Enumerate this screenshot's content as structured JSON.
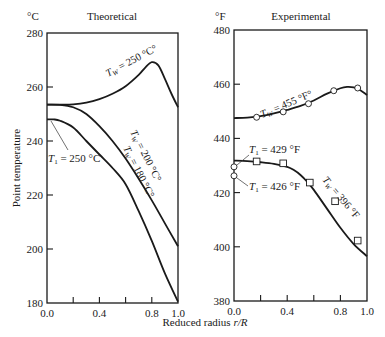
{
  "figure": {
    "ylabel": "Point temperature",
    "xlabel": "Reduced radius r/R",
    "xlabel_plain": "Reduced radius ",
    "xlabel_italic": "r/R"
  },
  "chart_data": [
    {
      "type": "line",
      "title": "Theoretical",
      "unit_label": "°C",
      "xlabel": "Reduced radius r/R",
      "ylabel": "Point temperature",
      "xlim": [
        0.0,
        1.0
      ],
      "ylim": [
        180,
        280
      ],
      "xticks": [
        0.0,
        0.2,
        0.4,
        0.6,
        0.8,
        1.0
      ],
      "xtick_labels": [
        "0.0",
        "0.4",
        "0.8",
        "1.0"
      ],
      "yticks": [
        180,
        200,
        220,
        240,
        260,
        280
      ],
      "ytick_labels": [
        "180",
        "200",
        "220",
        "240",
        "260",
        "280"
      ],
      "grid": false,
      "series": [
        {
          "name": "Tw = 250 °C",
          "label": "T_W = 250 °C",
          "x": [
            0.0,
            0.1,
            0.2,
            0.3,
            0.4,
            0.5,
            0.6,
            0.7,
            0.75,
            0.8,
            0.85,
            0.9,
            0.95,
            1.0
          ],
          "y": [
            253.5,
            253.5,
            253.6,
            254.2,
            255.5,
            257.5,
            260.3,
            264.5,
            267.2,
            269.2,
            268.0,
            263.0,
            257.5,
            252.5
          ]
        },
        {
          "name": "Tw = 200 °C",
          "label": "T_W = 200 °C",
          "x": [
            0.0,
            0.1,
            0.2,
            0.3,
            0.4,
            0.5,
            0.6,
            0.7,
            0.8,
            0.9,
            1.0
          ],
          "y": [
            253.5,
            253.4,
            252.5,
            250.0,
            245.5,
            240.0,
            233.5,
            226.0,
            218.0,
            209.5,
            201.0
          ]
        },
        {
          "name": "Tw = 180 °C",
          "label": "T_W = 180 °C",
          "x": [
            0.0,
            0.05,
            0.1,
            0.2,
            0.3,
            0.4,
            0.5,
            0.6,
            0.7,
            0.8,
            0.9,
            1.0
          ],
          "y": [
            248.0,
            248.0,
            247.5,
            245.0,
            240.0,
            235.0,
            230.0,
            224.0,
            214.0,
            203.0,
            191.0,
            180.5
          ]
        }
      ],
      "annotations": [
        {
          "text": "T_1 = 250 °C",
          "points_to": {
            "x": 0.02,
            "y": 248
          }
        }
      ]
    },
    {
      "type": "line",
      "title": "Experimental",
      "unit_label": "°F",
      "xlabel": "Reduced radius r/R",
      "xlim": [
        0.0,
        1.0
      ],
      "ylim": [
        380,
        480
      ],
      "xticks": [
        0.0,
        0.2,
        0.4,
        0.6,
        0.8,
        1.0
      ],
      "xtick_labels": [
        "0.0",
        "0.4",
        "0.8",
        "1.0"
      ],
      "yticks": [
        380,
        400,
        420,
        440,
        460,
        480
      ],
      "ytick_labels": [
        "380",
        "400",
        "420",
        "440",
        "460",
        "480"
      ],
      "grid": false,
      "series": [
        {
          "name": "Tw = 455 °F",
          "label": "T_W = 455 °F",
          "marker": "circle",
          "curve_x": [
            0.0,
            0.1,
            0.2,
            0.3,
            0.4,
            0.5,
            0.6,
            0.7,
            0.8,
            0.85,
            0.9,
            0.95,
            1.0
          ],
          "curve_y": [
            447.5,
            447.7,
            448.2,
            449.2,
            450.5,
            452.0,
            454.0,
            456.5,
            458.5,
            459.0,
            458.8,
            457.8,
            456.0
          ],
          "points_x": [
            0.17,
            0.37,
            0.56,
            0.75,
            0.93
          ],
          "points_y": [
            447.8,
            449.8,
            452.8,
            457.6,
            458.6
          ]
        },
        {
          "name": "Tw = 396 °F",
          "label": "T_W = 396 °F",
          "marker": "square",
          "curve_x": [
            0.0,
            0.1,
            0.2,
            0.3,
            0.4,
            0.45,
            0.5,
            0.55,
            0.6,
            0.7,
            0.8,
            0.9,
            1.0
          ],
          "curve_y": [
            431.8,
            431.6,
            431.2,
            430.6,
            429.5,
            428.3,
            426.5,
            424.0,
            421.0,
            414.0,
            407.0,
            401.0,
            396.5
          ],
          "points_x": [
            0.17,
            0.37,
            0.57,
            0.76,
            0.93
          ],
          "points_y": [
            431.5,
            430.8,
            423.7,
            416.8,
            402.3
          ]
        }
      ],
      "extra_points": [
        {
          "x": 0.0,
          "y": 429.5,
          "marker": "circle"
        },
        {
          "x": 0.0,
          "y": 426.2,
          "marker": "circle"
        }
      ],
      "annotations": [
        {
          "text": "T_1 = 429 °F",
          "points_to": {
            "x": 0.0,
            "y": 429.5
          }
        },
        {
          "text": "T_1 = 426 °F",
          "points_to": {
            "x": 0.0,
            "y": 426.2
          }
        }
      ]
    }
  ]
}
